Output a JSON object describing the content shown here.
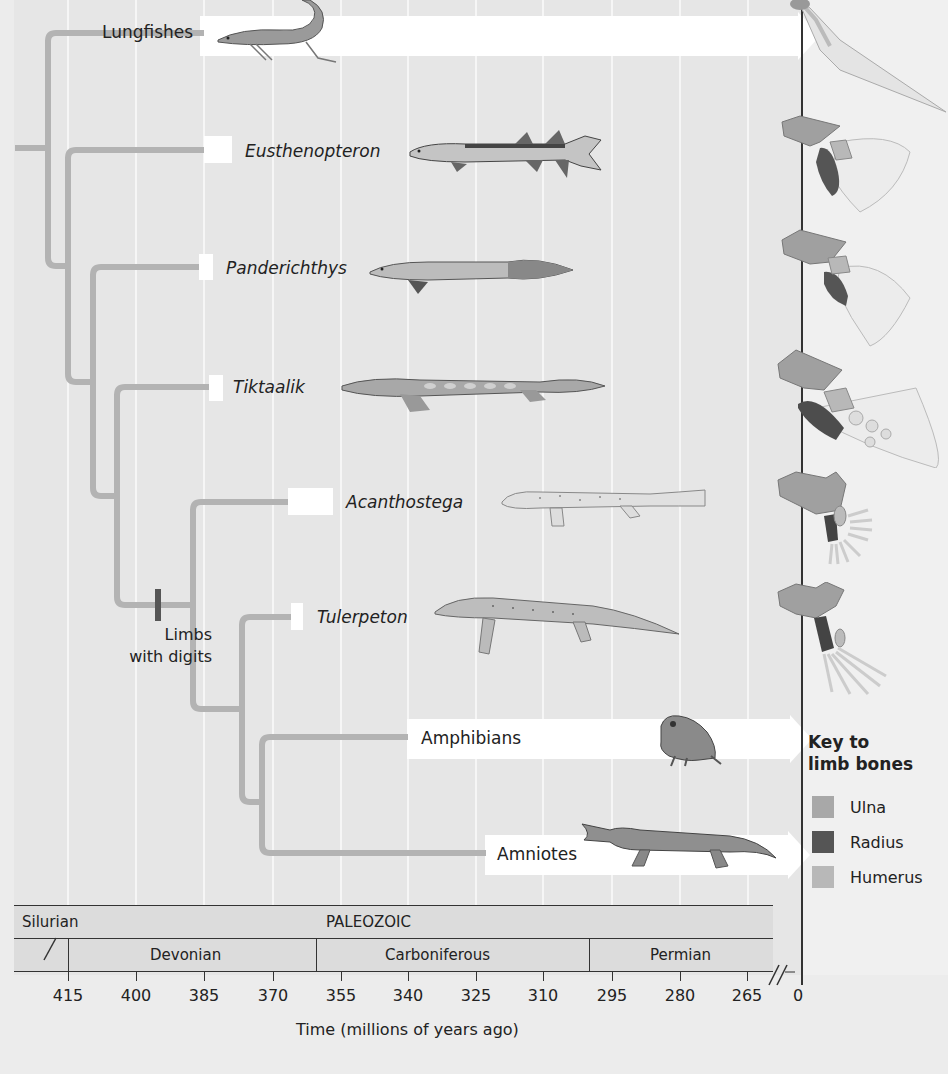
{
  "diagram": {
    "type": "phylogenetic-tree",
    "taxa": [
      {
        "name": "Lungfishes",
        "italic": false,
        "extant": true,
        "y": 34
      },
      {
        "name": "Eusthenopteron",
        "italic": true,
        "extant": false,
        "y": 151
      },
      {
        "name": "Panderichthys",
        "italic": true,
        "extant": false,
        "y": 267
      },
      {
        "name": "Tiktaalik",
        "italic": true,
        "extant": false,
        "y": 386
      },
      {
        "name": "Acanthostega",
        "italic": true,
        "extant": false,
        "y": 501
      },
      {
        "name": "Tulerpeton",
        "italic": true,
        "extant": false,
        "y": 616
      },
      {
        "name": "Amphibians",
        "italic": false,
        "extant": true,
        "y": 738
      },
      {
        "name": "Amniotes",
        "italic": false,
        "extant": true,
        "y": 853
      }
    ],
    "annotation": {
      "line1": "Limbs",
      "line2": "with digits"
    },
    "key": {
      "title_line1": "Key to",
      "title_line2": "limb bones",
      "items": [
        {
          "label": "Ulna",
          "color": "#a8a8a8"
        },
        {
          "label": "Radius",
          "color": "#555555"
        },
        {
          "label": "Humerus",
          "color": "#b8b8b8"
        }
      ]
    },
    "timeline": {
      "era": "PALEOZOIC",
      "periods": [
        "Silurian",
        "Devonian",
        "Carboniferous",
        "Permian"
      ]
    },
    "axis": {
      "title": "Time (millions of years ago)",
      "ticks": [
        "415",
        "400",
        "385",
        "370",
        "355",
        "340",
        "325",
        "310",
        "295",
        "280",
        "265",
        "0"
      ]
    },
    "colors": {
      "branch": "#b3b3b3",
      "background": "#e6e6e6",
      "label_box": "#ffffff",
      "axis": "#333333"
    }
  }
}
